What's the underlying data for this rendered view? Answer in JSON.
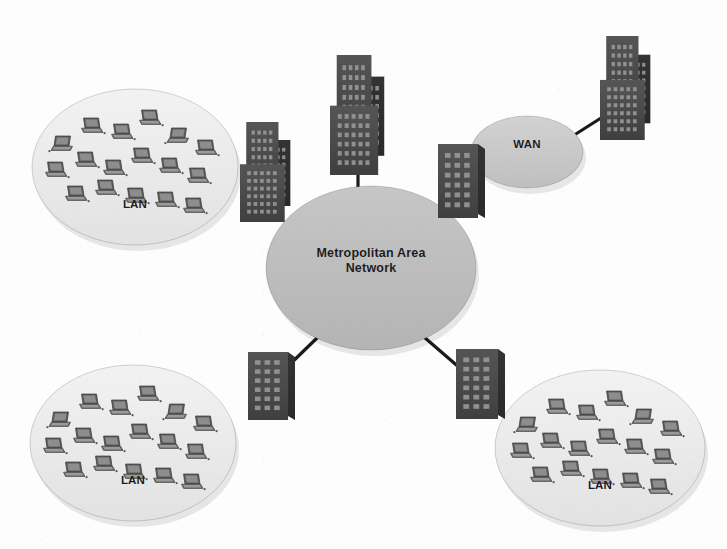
{
  "diagram": {
    "background_color": "#fdfdfd",
    "line_color": "#1a1a1a"
  },
  "nodes": {
    "lan_top_left": {
      "label": "LAN",
      "kind": "network-cloud",
      "fill": "#ededed",
      "cx": 135,
      "cy": 167,
      "rx": 103,
      "ry": 78,
      "label_x": 135,
      "label_y": 206,
      "hosts": 17
    },
    "lan_bottom_left": {
      "label": "LAN",
      "kind": "network-cloud",
      "fill": "#ededed",
      "cx": 133,
      "cy": 443,
      "rx": 103,
      "ry": 78,
      "label_x": 133,
      "label_y": 482,
      "hosts": 17
    },
    "lan_bottom_right": {
      "label": "LAN",
      "kind": "network-cloud",
      "fill": "#ededed",
      "cx": 600,
      "cy": 448,
      "rx": 105,
      "ry": 78,
      "label_x": 600,
      "label_y": 487,
      "hosts": 17
    },
    "man": {
      "label": "Metropolitan Area\nNetwork",
      "kind": "network-cloud",
      "fill": "#bdbdbd",
      "cx": 371,
      "cy": 268,
      "rx": 105,
      "ry": 82,
      "label_x": 371,
      "label_y": 254
    },
    "wan": {
      "label": "WAN",
      "kind": "network-cloud",
      "fill": "#c9c9c9",
      "cx": 527,
      "cy": 152,
      "rx": 56,
      "ry": 36,
      "label_x": 527,
      "label_y": 146
    }
  },
  "buildings": [
    {
      "name": "building-center-tall",
      "style": "tower",
      "x": 330,
      "y": 55,
      "w": 56,
      "h": 120,
      "fill": "#4a4a4a"
    },
    {
      "name": "building-left-tower",
      "style": "tower",
      "x": 240,
      "y": 122,
      "w": 52,
      "h": 100,
      "fill": "#4a4a4a"
    },
    {
      "name": "building-top-right",
      "style": "tower",
      "x": 600,
      "y": 36,
      "w": 52,
      "h": 104,
      "fill": "#4a4a4a"
    },
    {
      "name": "building-right-block",
      "style": "block",
      "x": 438,
      "y": 144,
      "w": 40,
      "h": 74,
      "fill": "#4a4a4a"
    },
    {
      "name": "building-bottom-left-block",
      "style": "block",
      "x": 248,
      "y": 352,
      "w": 40,
      "h": 68,
      "fill": "#4a4a4a"
    },
    {
      "name": "building-bottom-right-block",
      "style": "block",
      "x": 456,
      "y": 349,
      "w": 42,
      "h": 70,
      "fill": "#4a4a4a"
    }
  ],
  "links": [
    {
      "name": "link-man-to-center-tower",
      "x1": 358,
      "y1": 160,
      "x2": 358,
      "y2": 193
    },
    {
      "name": "link-man-to-bottom-left",
      "x1": 318,
      "y1": 337,
      "x2": 283,
      "y2": 371
    },
    {
      "name": "link-man-to-bottom-right",
      "x1": 424,
      "y1": 337,
      "x2": 461,
      "y2": 369
    },
    {
      "name": "link-wan-to-top-right-tower",
      "x1": 568,
      "y1": 139,
      "x2": 612,
      "y2": 111
    }
  ],
  "hosts_layout": {
    "note": "relative laptop positions inside each LAN ellipse, in ellipse-local px",
    "points": [
      {
        "x": -72,
        "y": -22,
        "flip": true
      },
      {
        "x": -44,
        "y": -40,
        "flip": false
      },
      {
        "x": -14,
        "y": -34,
        "flip": false
      },
      {
        "x": 14,
        "y": -48,
        "flip": false
      },
      {
        "x": 44,
        "y": -30,
        "flip": true
      },
      {
        "x": 70,
        "y": -18,
        "flip": false
      },
      {
        "x": -80,
        "y": 4,
        "flip": false
      },
      {
        "x": -50,
        "y": -6,
        "flip": false
      },
      {
        "x": -22,
        "y": 2,
        "flip": false
      },
      {
        "x": 6,
        "y": -10,
        "flip": false
      },
      {
        "x": 34,
        "y": 0,
        "flip": false
      },
      {
        "x": 62,
        "y": 10,
        "flip": false
      },
      {
        "x": -60,
        "y": 28,
        "flip": false
      },
      {
        "x": -30,
        "y": 22,
        "flip": false
      },
      {
        "x": 0,
        "y": 30,
        "flip": false
      },
      {
        "x": 30,
        "y": 34,
        "flip": false
      },
      {
        "x": 58,
        "y": 40,
        "flip": false
      }
    ]
  }
}
